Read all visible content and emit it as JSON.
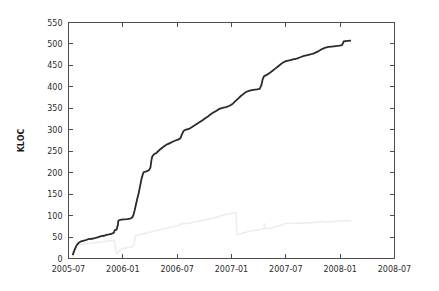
{
  "chart_data": {
    "type": "line",
    "title": "",
    "subtitle": "",
    "xlabel": "",
    "ylabel": "KLOC",
    "ylim": [
      0,
      550
    ],
    "xlim": [
      "2005-07",
      "2008-07"
    ],
    "ytick_labels": [
      "0",
      "50",
      "100",
      "150",
      "200",
      "250",
      "300",
      "350",
      "400",
      "450",
      "500",
      "550"
    ],
    "ytick_values": [
      0,
      50,
      100,
      150,
      200,
      250,
      300,
      350,
      400,
      450,
      500,
      550
    ],
    "xtick_labels": [
      "2005-07",
      "2006-01",
      "2006-07",
      "2007-01",
      "2007-07",
      "2008-01",
      "2008-07"
    ],
    "xtick_values": [
      0,
      6,
      12,
      18,
      24,
      30,
      36
    ],
    "grid": false,
    "legend": "none",
    "x_unit": "months since 2005-07",
    "series": [
      {
        "name": "total-code",
        "color": "#2b2b2b",
        "width": 1.8,
        "points": [
          [
            0.45,
            8
          ],
          [
            0.7,
            22
          ],
          [
            0.9,
            31
          ],
          [
            1.1,
            36
          ],
          [
            1.4,
            40
          ],
          [
            1.8,
            42
          ],
          [
            2.2,
            45
          ],
          [
            2.6,
            46
          ],
          [
            3.0,
            48
          ],
          [
            3.3,
            50
          ],
          [
            3.6,
            52
          ],
          [
            3.9,
            53
          ],
          [
            4.2,
            55
          ],
          [
            4.5,
            56
          ],
          [
            4.8,
            58
          ],
          [
            5.0,
            60
          ],
          [
            5.1,
            66
          ],
          [
            5.3,
            67
          ],
          [
            5.45,
            78
          ],
          [
            5.5,
            88
          ],
          [
            5.7,
            90
          ],
          [
            6.1,
            91
          ],
          [
            6.5,
            92
          ],
          [
            6.8,
            93
          ],
          [
            7.0,
            95
          ],
          [
            7.15,
            100
          ],
          [
            7.3,
            112
          ],
          [
            7.45,
            126
          ],
          [
            7.6,
            140
          ],
          [
            7.75,
            152
          ],
          [
            7.9,
            168
          ],
          [
            8.05,
            184
          ],
          [
            8.2,
            196
          ],
          [
            8.3,
            201
          ],
          [
            8.6,
            203
          ],
          [
            8.9,
            206
          ],
          [
            9.05,
            212
          ],
          [
            9.15,
            228
          ],
          [
            9.25,
            238
          ],
          [
            9.45,
            243
          ],
          [
            9.7,
            246
          ],
          [
            9.9,
            250
          ],
          [
            10.1,
            254
          ],
          [
            10.35,
            258
          ],
          [
            10.6,
            262
          ],
          [
            10.9,
            266
          ],
          [
            11.2,
            269
          ],
          [
            11.5,
            272
          ],
          [
            11.8,
            275
          ],
          [
            12.1,
            277
          ],
          [
            12.35,
            280
          ],
          [
            12.5,
            288
          ],
          [
            12.7,
            297
          ],
          [
            12.9,
            300
          ],
          [
            13.3,
            302
          ],
          [
            13.6,
            306
          ],
          [
            13.9,
            310
          ],
          [
            14.2,
            314
          ],
          [
            14.5,
            318
          ],
          [
            14.8,
            322
          ],
          [
            15.1,
            327
          ],
          [
            15.4,
            331
          ],
          [
            15.7,
            336
          ],
          [
            16.0,
            340
          ],
          [
            16.3,
            344
          ],
          [
            16.6,
            348
          ],
          [
            17.0,
            351
          ],
          [
            17.4,
            353
          ],
          [
            17.8,
            356
          ],
          [
            18.1,
            360
          ],
          [
            18.4,
            366
          ],
          [
            18.7,
            372
          ],
          [
            19.0,
            378
          ],
          [
            19.3,
            383
          ],
          [
            19.6,
            388
          ],
          [
            20.0,
            391
          ],
          [
            20.4,
            393
          ],
          [
            20.8,
            394
          ],
          [
            21.1,
            395
          ],
          [
            21.3,
            404
          ],
          [
            21.45,
            418
          ],
          [
            21.6,
            425
          ],
          [
            21.9,
            428
          ],
          [
            22.2,
            432
          ],
          [
            22.5,
            437
          ],
          [
            22.8,
            442
          ],
          [
            23.1,
            447
          ],
          [
            23.4,
            452
          ],
          [
            23.7,
            457
          ],
          [
            24.0,
            460
          ],
          [
            24.4,
            462
          ],
          [
            24.8,
            464
          ],
          [
            25.2,
            466
          ],
          [
            25.6,
            469
          ],
          [
            26.0,
            472
          ],
          [
            26.4,
            474
          ],
          [
            26.8,
            476
          ],
          [
            27.1,
            478
          ],
          [
            27.5,
            482
          ],
          [
            27.9,
            487
          ],
          [
            28.3,
            491
          ],
          [
            28.7,
            493
          ],
          [
            29.1,
            494
          ],
          [
            29.5,
            495
          ],
          [
            29.9,
            496
          ],
          [
            30.2,
            497
          ],
          [
            30.4,
            506
          ],
          [
            30.8,
            507
          ],
          [
            31.2,
            508
          ]
        ]
      },
      {
        "name": "comment-blank-code",
        "color": "#ededed",
        "width": 1.6,
        "points": [
          [
            0.45,
            3
          ],
          [
            0.65,
            14
          ],
          [
            0.85,
            24
          ],
          [
            1.05,
            30
          ],
          [
            1.3,
            33
          ],
          [
            1.7,
            34
          ],
          [
            2.1,
            35
          ],
          [
            2.5,
            36
          ],
          [
            2.9,
            37
          ],
          [
            3.3,
            38
          ],
          [
            3.7,
            39
          ],
          [
            4.1,
            40
          ],
          [
            4.5,
            41
          ],
          [
            4.9,
            42
          ],
          [
            5.05,
            43
          ],
          [
            5.15,
            28
          ],
          [
            5.25,
            16
          ],
          [
            5.35,
            12
          ],
          [
            5.5,
            14
          ],
          [
            5.7,
            20
          ],
          [
            5.9,
            23
          ],
          [
            6.2,
            24
          ],
          [
            6.5,
            25
          ],
          [
            6.8,
            26
          ],
          [
            7.0,
            27
          ],
          [
            7.15,
            31
          ],
          [
            7.25,
            34
          ],
          [
            7.35,
            52
          ],
          [
            7.5,
            54
          ],
          [
            7.8,
            55
          ],
          [
            8.1,
            57
          ],
          [
            8.5,
            59
          ],
          [
            8.9,
            61
          ],
          [
            9.3,
            63
          ],
          [
            9.7,
            65
          ],
          [
            10.1,
            67
          ],
          [
            10.5,
            69
          ],
          [
            10.9,
            71
          ],
          [
            11.3,
            73
          ],
          [
            11.7,
            75
          ],
          [
            12.1,
            77
          ],
          [
            12.4,
            80
          ],
          [
            12.6,
            82
          ],
          [
            12.9,
            81
          ],
          [
            13.3,
            82
          ],
          [
            13.7,
            84
          ],
          [
            14.1,
            86
          ],
          [
            14.5,
            87
          ],
          [
            14.9,
            89
          ],
          [
            15.3,
            91
          ],
          [
            15.7,
            93
          ],
          [
            16.1,
            95
          ],
          [
            16.5,
            97
          ],
          [
            16.9,
            100
          ],
          [
            17.3,
            102
          ],
          [
            17.7,
            104
          ],
          [
            18.0,
            105
          ],
          [
            18.3,
            106
          ],
          [
            18.5,
            106
          ],
          [
            18.55,
            74
          ],
          [
            18.6,
            56
          ],
          [
            19.0,
            57
          ],
          [
            19.4,
            60
          ],
          [
            19.8,
            63
          ],
          [
            20.2,
            64
          ],
          [
            20.6,
            66
          ],
          [
            21.0,
            67
          ],
          [
            21.4,
            68
          ],
          [
            21.6,
            70
          ],
          [
            21.65,
            82
          ],
          [
            21.7,
            70
          ],
          [
            21.9,
            70
          ],
          [
            22.3,
            71
          ],
          [
            22.7,
            73
          ],
          [
            23.1,
            75
          ],
          [
            23.5,
            78
          ],
          [
            23.8,
            81
          ],
          [
            24.2,
            82
          ],
          [
            24.6,
            82
          ],
          [
            25.0,
            82
          ],
          [
            25.4,
            82
          ],
          [
            25.8,
            82
          ],
          [
            26.2,
            83
          ],
          [
            26.6,
            83
          ],
          [
            27.0,
            84
          ],
          [
            27.4,
            84
          ],
          [
            27.6,
            86
          ],
          [
            28.0,
            86
          ],
          [
            28.4,
            85
          ],
          [
            28.8,
            85
          ],
          [
            29.2,
            86
          ],
          [
            29.6,
            87
          ],
          [
            30.0,
            88
          ],
          [
            30.4,
            88
          ],
          [
            30.8,
            88
          ],
          [
            31.2,
            88
          ]
        ]
      }
    ]
  }
}
